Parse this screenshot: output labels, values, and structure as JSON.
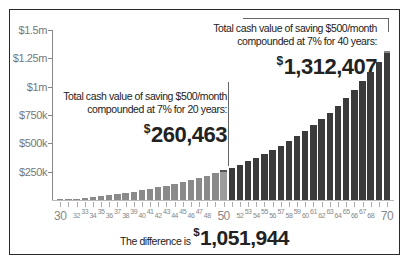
{
  "chart_data": {
    "type": "bar",
    "title": "",
    "xlabel": "",
    "ylabel": "",
    "ylim": [
      0,
      1500000
    ],
    "yticks": [
      {
        "value": 1500000,
        "label": "$1.5m"
      },
      {
        "value": 1250000,
        "label": "$1.25m"
      },
      {
        "value": 1000000,
        "label": "$1m"
      },
      {
        "value": 750000,
        "label": "$750k"
      },
      {
        "value": 500000,
        "label": "$500k"
      },
      {
        "value": 250000,
        "label": "$250k"
      }
    ],
    "categories": [
      30,
      31,
      32,
      33,
      34,
      35,
      36,
      37,
      38,
      39,
      40,
      41,
      42,
      43,
      44,
      45,
      46,
      47,
      48,
      49,
      50,
      51,
      52,
      53,
      54,
      55,
      56,
      57,
      58,
      59,
      60,
      61,
      62,
      63,
      64,
      65,
      66,
      67,
      68,
      69,
      70
    ],
    "xtick_labels_big": [
      30,
      50,
      70
    ],
    "xtick_labels_small": [
      32,
      33,
      34,
      35,
      36,
      37,
      38,
      39,
      40,
      41,
      42,
      43,
      44,
      45,
      46,
      47,
      48,
      52,
      53,
      54,
      55,
      56,
      57,
      58,
      59,
      60,
      61,
      62,
      63,
      64,
      65,
      66,
      67,
      68
    ],
    "values": [
      0,
      6198,
      12845,
      19972,
      27613,
      35806,
      44591,
      54011,
      64111,
      74941,
      86553,
      99005,
      112356,
      126672,
      142023,
      158483,
      176133,
      195058,
      215350,
      237109,
      260463,
      285433,
      312214,
      340930,
      371722,
      404739,
      440142,
      478104,
      518810,
      562457,
      609260,
      659444,
      713255,
      770955,
      832825,
      899167,
      970304,
      1046581,
      1128371,
      1216072,
      1312407
    ],
    "series_colors": {
      "first_20_years": "#8a8a8a",
      "age_50_highlight": "#9c9c9c",
      "last_20_years": "#3b3b3b"
    },
    "grid": false,
    "legend": null,
    "annotations": [
      {
        "text_line1": "Total cash value of saving $500/month",
        "text_line2": "compounded at 7% for 20 years:",
        "value": "260,463",
        "currency": "$",
        "points_to": 50
      },
      {
        "text_line1": "Total cash value of saving $500/month",
        "text_line2": "compounded at 7% for 40 years:",
        "value": "1,312,407",
        "currency": "$",
        "points_to": 70
      }
    ],
    "footer": {
      "prefix": "The difference is",
      "currency": "$",
      "value": "1,051,944"
    }
  }
}
